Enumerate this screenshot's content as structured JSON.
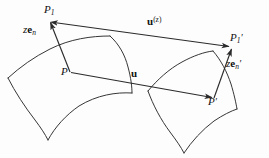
{
  "figure": {
    "kind": "geometry-diagram",
    "background_color": "#fdfdfd",
    "stroke_color": "#2b2b2b",
    "text_color": "#111111",
    "width": 269,
    "height": 158
  },
  "labels": {
    "point_p1": {
      "base": "P",
      "sub": "1",
      "prime": ""
    },
    "vector_zen": {
      "scalar": "z",
      "bold": "e",
      "sub": "n",
      "prime": ""
    },
    "vector_uz": {
      "bold": "u",
      "sup": "(z)"
    },
    "point_p1_prime": {
      "base": "P",
      "sub": "1",
      "prime": "′"
    },
    "vector_zen_prime": {
      "scalar": "z",
      "bold": "e",
      "sub": "n",
      "prime": "′"
    },
    "point_p": {
      "base": "P",
      "sub": "",
      "prime": ""
    },
    "vector_u": {
      "bold": "u",
      "sup": ""
    },
    "point_p_prime": {
      "base": "P",
      "sub": "",
      "prime": "′"
    }
  },
  "geometry": {
    "left_patch": {
      "name": "undeformed-surface-patch",
      "path": "M 8 78 C 22 66 36 56 52 49 C 72 40 92 37 110 36 M 110 36 C 120 45 126 57 129 70 C 131 79 132 87 132 93 M 8 78 C 16 93 26 108 36 121 C 41 128 45 134 48 139 M 48 139 C 56 126 67 115 80 107 C 98 96 116 93 132 93"
    },
    "right_patch": {
      "name": "deformed-surface-patch",
      "path": "M 148 91 C 158 80 170 70 183 63 C 194 57 204 53 213 51 M 213 51 C 221 60 227 72 231 85 C 234 94 236 102 237 108 M 148 91 C 154 106 162 121 171 133 C 176 140 181 147 184 152 M 184 152 C 192 140 203 129 215 121 C 223 116 231 112 237 108"
    },
    "vectors": [
      {
        "name": "zen-vector",
        "from": [
          70,
          72
        ],
        "to": [
          49,
          20
        ],
        "arrow_at": "to"
      },
      {
        "name": "uz-vector",
        "from": [
          52,
          22
        ],
        "to": [
          231,
          47
        ],
        "arrow_at": "both"
      },
      {
        "name": "u-vector",
        "from": [
          70,
          72
        ],
        "to": [
          213,
          98
        ],
        "arrow_at": "to"
      },
      {
        "name": "zen-prime-vector",
        "from": [
          213,
          98
        ],
        "to": [
          232,
          48
        ],
        "arrow_at": "to"
      }
    ]
  }
}
